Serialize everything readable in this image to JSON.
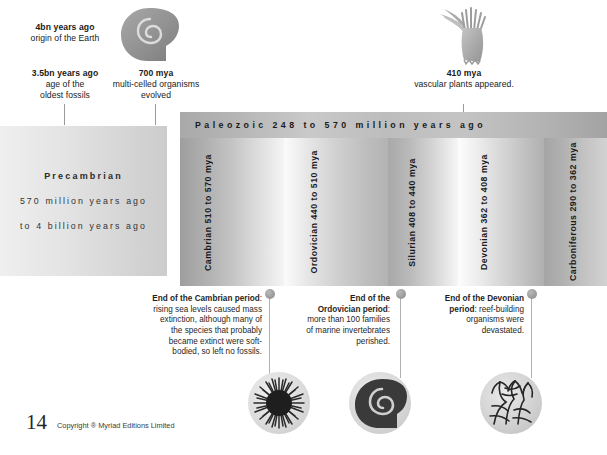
{
  "page": {
    "number": "14",
    "copyright": "Copyright ® Myriad Editions Limited"
  },
  "top_events": [
    {
      "id": "origin-of-earth",
      "headline": "4bn years ago",
      "detail": "origin of the Earth"
    },
    {
      "id": "oldest-fossils",
      "headline": "3.5bn years ago",
      "detail": "age of the\noldest fossils"
    },
    {
      "id": "multicelled-organisms",
      "headline": "700 mya",
      "detail": "multi-celled organisms\nevolved"
    },
    {
      "id": "vascular-plants",
      "headline": "410 mya",
      "detail": "vascular plants appeared."
    }
  ],
  "icons": {
    "ammonite_top": "ammonite-spiral-icon",
    "plant_top": "vascular-plant-icon"
  },
  "eon_header": {
    "label": "Paleozoic 248 to 570 million years ago"
  },
  "precambrian": {
    "title": "Precambrian",
    "line1": "570 million years ago",
    "line2": "to 4 billion years ago"
  },
  "periods": [
    {
      "id": "cambrian",
      "label": "Cambrian 510 to 570 mya"
    },
    {
      "id": "ordovician",
      "label": "Ordovician 440 to 510 mya"
    },
    {
      "id": "silurian",
      "label": "Silurian 408 to 440 mya"
    },
    {
      "id": "devonian",
      "label": "Devonian 362 to 408 mya"
    },
    {
      "id": "carboniferous",
      "label": "Carboniferous 290 to 362 mya"
    }
  ],
  "extinctions": [
    {
      "id": "end-cambrian",
      "title": "End of the Cambrian period",
      "body": ": rising sea levels caused mass extinction, although many of the species that probably became extinct were soft-bodied, so left no fossils.",
      "illustration": "sea-urchin-fossil-icon"
    },
    {
      "id": "end-ordovician",
      "title": "End of the Ordovician period",
      "body": ": more than 100 families of marine invertebrates perished.",
      "illustration": "ammonite-fossil-icon"
    },
    {
      "id": "end-devonian",
      "title": "End of the Devonian period",
      "body": ": reef-building organisms were devastated.",
      "illustration": "coral-reef-fossil-icon"
    }
  ],
  "chart_data": {
    "type": "timeline",
    "title": "Paleozoic 248 to 570 million years ago",
    "unit": "million years ago (mya)",
    "eras": [
      {
        "name": "Precambrian",
        "start_mya": 4000,
        "end_mya": 570
      },
      {
        "name": "Paleozoic",
        "start_mya": 570,
        "end_mya": 248
      }
    ],
    "periods": [
      {
        "name": "Cambrian",
        "start_mya": 570,
        "end_mya": 510
      },
      {
        "name": "Ordovician",
        "start_mya": 510,
        "end_mya": 440
      },
      {
        "name": "Silurian",
        "start_mya": 440,
        "end_mya": 408
      },
      {
        "name": "Devonian",
        "start_mya": 408,
        "end_mya": 362
      },
      {
        "name": "Carboniferous",
        "start_mya": 362,
        "end_mya": 290
      }
    ],
    "events": [
      {
        "label": "origin of the Earth",
        "value_mya": 4000
      },
      {
        "label": "age of the oldest fossils",
        "value_mya": 3500
      },
      {
        "label": "multi-celled organisms evolved",
        "value_mya": 700
      },
      {
        "label": "vascular plants appeared",
        "value_mya": 410
      }
    ],
    "extinction_events": [
      {
        "label": "End of the Cambrian period",
        "value_mya": 510
      },
      {
        "label": "End of the Ordovician period",
        "value_mya": 440
      },
      {
        "label": "End of the Devonian period",
        "value_mya": 362
      }
    ]
  }
}
